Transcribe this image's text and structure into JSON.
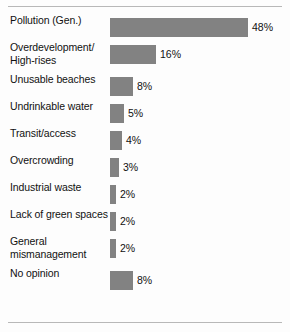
{
  "chart_data": {
    "type": "bar",
    "orientation": "horizontal",
    "title": "",
    "xlabel": "",
    "ylabel": "",
    "value_suffix": "%",
    "xlim": [
      0,
      48
    ],
    "grid": false,
    "legend": null,
    "bar_color": "#828282",
    "text_color": "#111111",
    "background": "#fdfdfd",
    "categories": [
      "Pollution (Gen.)",
      "Overdevelopment/ High-rises",
      "Unusable beaches",
      "Undrinkable water",
      "Transit/access",
      "Overcrowding",
      "Industrial waste",
      "Lack of green spaces",
      "General mismanagement",
      "No opinion"
    ],
    "values": [
      48,
      16,
      8,
      5,
      4,
      3,
      2,
      2,
      2,
      8
    ],
    "value_labels": [
      "48%",
      "16%",
      "8%",
      "5%",
      "4%",
      "3%",
      "2%",
      "2%",
      "2%",
      "8%"
    ]
  },
  "rows": [
    {
      "label_line1": "Pollution (Gen.)",
      "label_line2": "",
      "value": 48,
      "value_label": "48%"
    },
    {
      "label_line1": "Overdevelopment/",
      "label_line2": "High-rises",
      "value": 16,
      "value_label": "16%"
    },
    {
      "label_line1": "Unusable beaches",
      "label_line2": "",
      "value": 8,
      "value_label": "8%"
    },
    {
      "label_line1": "Undrinkable water",
      "label_line2": "",
      "value": 5,
      "value_label": "5%"
    },
    {
      "label_line1": "Transit/access",
      "label_line2": "",
      "value": 4,
      "value_label": "4%"
    },
    {
      "label_line1": "Overcrowding",
      "label_line2": "",
      "value": 3,
      "value_label": "3%"
    },
    {
      "label_line1": "Industrial waste",
      "label_line2": "",
      "value": 2,
      "value_label": "2%"
    },
    {
      "label_line1": "Lack of green spaces",
      "label_line2": "",
      "value": 2,
      "value_label": "2%"
    },
    {
      "label_line1": "General",
      "label_line2": "mismanagement",
      "value": 2,
      "value_label": "2%"
    },
    {
      "label_line1": "No opinion",
      "label_line2": "",
      "value": 8,
      "value_label": "8%"
    }
  ]
}
